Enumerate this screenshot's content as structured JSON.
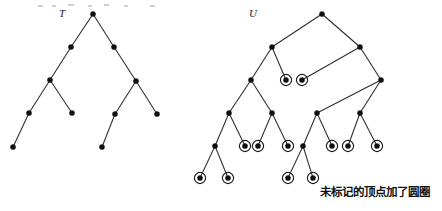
{
  "figure": {
    "width": 442,
    "height": 211,
    "background_color": "#ffffff",
    "node_color": "#101010",
    "edge_color": "#2b2b2b",
    "ring_color": "#1a1a1a",
    "node_radius": 2.6,
    "ring_radius": 5.6
  },
  "labels": {
    "tree_t": "T",
    "tree_u": "U"
  },
  "caption": {
    "text": "未标记的顶点加了圆圈",
    "x": 320,
    "y": 196
  },
  "trees": [
    {
      "name": "T",
      "label": "T",
      "label_x": 59,
      "label_y": 17,
      "nodes": [
        {
          "id": "t-root",
          "x": 93,
          "y": 14,
          "circled": false
        },
        {
          "id": "t-l1",
          "x": 71,
          "y": 47,
          "circled": false
        },
        {
          "id": "t-r1",
          "x": 114,
          "y": 47,
          "circled": false
        },
        {
          "id": "t-l2",
          "x": 50,
          "y": 80,
          "circled": false
        },
        {
          "id": "t-r2",
          "x": 136,
          "y": 81,
          "circled": false
        },
        {
          "id": "t-l3a",
          "x": 29,
          "y": 113,
          "circled": false
        },
        {
          "id": "t-l3b",
          "x": 72,
          "y": 113,
          "circled": false
        },
        {
          "id": "t-r3a",
          "x": 115,
          "y": 114,
          "circled": false
        },
        {
          "id": "t-r3b",
          "x": 157,
          "y": 114,
          "circled": false
        },
        {
          "id": "t-l4",
          "x": 13,
          "y": 147,
          "circled": false
        },
        {
          "id": "t-r4",
          "x": 102,
          "y": 147,
          "circled": false
        }
      ],
      "edges": [
        [
          "t-root",
          "t-l1"
        ],
        [
          "t-root",
          "t-r1"
        ],
        [
          "t-l1",
          "t-l2"
        ],
        [
          "t-r1",
          "t-r2"
        ],
        [
          "t-l2",
          "t-l3a"
        ],
        [
          "t-l2",
          "t-l3b"
        ],
        [
          "t-r2",
          "t-r3a"
        ],
        [
          "t-r2",
          "t-r3b"
        ],
        [
          "t-l3a",
          "t-l4"
        ],
        [
          "t-r3a",
          "t-r4"
        ]
      ]
    },
    {
      "name": "U",
      "label": "U",
      "label_x": 249,
      "label_y": 17,
      "nodes": [
        {
          "id": "u-root",
          "x": 322,
          "y": 14,
          "circled": false
        },
        {
          "id": "u-l1",
          "x": 272,
          "y": 47,
          "circled": false
        },
        {
          "id": "u-r1",
          "x": 360,
          "y": 47,
          "circled": false
        },
        {
          "id": "u-c2a",
          "x": 286,
          "y": 80,
          "circled": true
        },
        {
          "id": "u-c2b",
          "x": 302,
          "y": 80,
          "circled": true
        },
        {
          "id": "u-l2",
          "x": 251,
          "y": 80,
          "circled": false
        },
        {
          "id": "u-r2",
          "x": 381,
          "y": 80,
          "circled": false
        },
        {
          "id": "u-l3a",
          "x": 229,
          "y": 113,
          "circled": false
        },
        {
          "id": "u-l3b",
          "x": 272,
          "y": 113,
          "circled": false
        },
        {
          "id": "u-r3a",
          "x": 317,
          "y": 113,
          "circled": false
        },
        {
          "id": "u-r3b",
          "x": 360,
          "y": 113,
          "circled": false
        },
        {
          "id": "u-l4a",
          "x": 215,
          "y": 146,
          "circled": false
        },
        {
          "id": "u-l4b",
          "x": 245,
          "y": 146,
          "circled": true
        },
        {
          "id": "u-l4c",
          "x": 258,
          "y": 146,
          "circled": true
        },
        {
          "id": "u-l4d",
          "x": 288,
          "y": 146,
          "circled": true
        },
        {
          "id": "u-r4a",
          "x": 303,
          "y": 146,
          "circled": false
        },
        {
          "id": "u-r4b",
          "x": 332,
          "y": 146,
          "circled": true
        },
        {
          "id": "u-r4c",
          "x": 348,
          "y": 146,
          "circled": true
        },
        {
          "id": "u-r4d",
          "x": 377,
          "y": 146,
          "circled": true
        },
        {
          "id": "u-l5a",
          "x": 200,
          "y": 178,
          "circled": true
        },
        {
          "id": "u-l5b",
          "x": 228,
          "y": 178,
          "circled": true
        },
        {
          "id": "u-r5a",
          "x": 288,
          "y": 178,
          "circled": true
        },
        {
          "id": "u-r5b",
          "x": 313,
          "y": 178,
          "circled": true
        }
      ],
      "edges": [
        [
          "u-root",
          "u-l1"
        ],
        [
          "u-root",
          "u-r1"
        ],
        [
          "u-l1",
          "u-l2"
        ],
        [
          "u-l1",
          "u-c2a"
        ],
        [
          "u-r1",
          "u-c2b"
        ],
        [
          "u-r1",
          "u-r2"
        ],
        [
          "u-l2",
          "u-l3a"
        ],
        [
          "u-l2",
          "u-l3b"
        ],
        [
          "u-r2",
          "u-r3a"
        ],
        [
          "u-r2",
          "u-r3b"
        ],
        [
          "u-l3a",
          "u-l4a"
        ],
        [
          "u-l3a",
          "u-l4b"
        ],
        [
          "u-l3b",
          "u-l4c"
        ],
        [
          "u-l3b",
          "u-l4d"
        ],
        [
          "u-r3a",
          "u-r4a"
        ],
        [
          "u-r3a",
          "u-r4b"
        ],
        [
          "u-r3b",
          "u-r4c"
        ],
        [
          "u-r3b",
          "u-r4d"
        ],
        [
          "u-l4a",
          "u-l5a"
        ],
        [
          "u-l4a",
          "u-l5b"
        ],
        [
          "u-r4a",
          "u-r5a"
        ],
        [
          "u-r4a",
          "u-r5b"
        ]
      ]
    }
  ],
  "specks": [
    {
      "x": 38,
      "y": 5,
      "w": 5,
      "h": 2
    },
    {
      "x": 52,
      "y": 5,
      "w": 4,
      "h": 2
    },
    {
      "x": 68,
      "y": 4,
      "w": 6,
      "h": 2
    },
    {
      "x": 88,
      "y": 5,
      "w": 4,
      "h": 2
    },
    {
      "x": 104,
      "y": 4,
      "w": 5,
      "h": 2
    },
    {
      "x": 124,
      "y": 5,
      "w": 4,
      "h": 2
    },
    {
      "x": 150,
      "y": 5,
      "w": 5,
      "h": 2
    }
  ]
}
